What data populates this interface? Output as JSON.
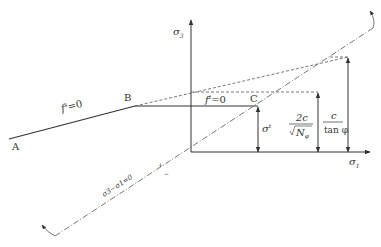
{
  "diagram": {
    "type": "yield-surface-diagram",
    "axes": {
      "vertical_label": "σ",
      "vertical_sub": "3",
      "horizontal_label": "σ",
      "horizontal_sub": "1"
    },
    "points": {
      "A": "A",
      "B": "B",
      "C": "C"
    },
    "curve_labels": {
      "shear_f": "f",
      "shear_sup": "s",
      "shear_eq": "=0",
      "tension_f": "f",
      "tension_sup": "t",
      "tension_eq": "=0"
    },
    "diagonal": {
      "label": "σ3−σ1=0",
      "plus": "+",
      "minus": "−"
    },
    "dimensions": {
      "tensile_label": "σ",
      "tensile_sup": "t",
      "mid_numerator": "2c",
      "mid_denominator": "N",
      "mid_den_sub": "φ",
      "top_numerator": "c",
      "top_denominator": "tan φ"
    },
    "colors": {
      "line": "#333333",
      "dashed": "#555555"
    }
  }
}
